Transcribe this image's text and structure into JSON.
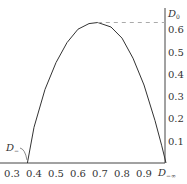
{
  "chart_data": {
    "type": "line",
    "title": "",
    "xlabel": "",
    "ylabel": "D0",
    "xlim": [
      0.3,
      1.0
    ],
    "ylim": [
      0,
      0.65
    ],
    "grid": false,
    "legend": "none",
    "x_ticks": [
      "0.3",
      "0.4",
      "0.5",
      "0.6",
      "0.7",
      "0.8",
      "0.9"
    ],
    "y_ticks": [
      "0.1",
      "0.2",
      "0.3",
      "0.4",
      "0.5",
      "0.6"
    ],
    "series": [
      {
        "name": "curve",
        "x": [
          0.37,
          0.4,
          0.45,
          0.5,
          0.55,
          0.6,
          0.65,
          0.69,
          0.75,
          0.8,
          0.85,
          0.9,
          0.95,
          0.98,
          1.0
        ],
        "y": [
          0.0,
          0.16,
          0.33,
          0.45,
          0.54,
          0.6,
          0.625,
          0.63,
          0.61,
          0.56,
          0.47,
          0.35,
          0.19,
          0.08,
          0.0
        ]
      }
    ],
    "annotations": [
      {
        "text": "D0",
        "position": "top of y-axis",
        "meaning": "peak value marker"
      },
      {
        "text": "D−",
        "position": "left, curve start near x=0.37"
      },
      {
        "text": "D−∞",
        "position": "right end of x-axis, x=1.0"
      },
      {
        "type": "dashed-line",
        "from_x": 0.69,
        "to_x": 1.0,
        "y": 0.63
      }
    ]
  },
  "labels": {
    "y_axis_top": "D",
    "y_axis_top_sub": "0",
    "curve_start": "D",
    "curve_start_sub": "−",
    "axis_end": "D",
    "axis_end_sub": "−∞"
  }
}
